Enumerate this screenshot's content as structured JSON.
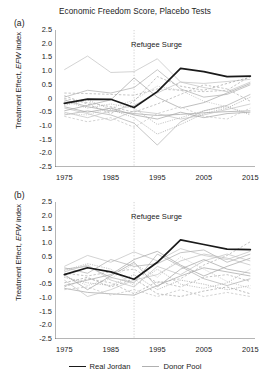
{
  "figure": {
    "title": "Economic Freedom Score, Placebo Tests",
    "panels": [
      {
        "tag": "(a)",
        "annotation": "Refugee Surge"
      },
      {
        "tag": "(b)",
        "annotation": "Refugee Surge"
      }
    ],
    "legend": [
      {
        "label": "Real Jordan",
        "color": "#1a1a1a",
        "style": "solid"
      },
      {
        "label": "Donor Pool",
        "color": "#b0b0b0",
        "style": "solid"
      }
    ]
  },
  "chart_data": {
    "type": "line",
    "title": "Economic Freedom Score, Placebo Tests",
    "xlabel": "",
    "ylabel": "Treatment Effect, EFW index",
    "xlim": [
      1973,
      2016
    ],
    "ylim": [
      -2.5,
      2.5
    ],
    "xticks": [
      1975,
      1985,
      1995,
      2005,
      2015
    ],
    "yticks": [
      "2.5",
      "2.0",
      "1.5",
      "1.0",
      "0.5",
      "0",
      "-0.5",
      "-1.0",
      "-1.5",
      "-2.0",
      "-2.5"
    ],
    "grid": false,
    "legend_position": "bottom-center",
    "annotations": [
      {
        "text": "Refugee Surge",
        "x": 1990,
        "y": 1.95,
        "vline_x": 1990,
        "vline_style": "dotted"
      }
    ],
    "x": [
      1975,
      1980,
      1985,
      1990,
      1995,
      2000,
      2005,
      2010,
      2015
    ],
    "panels": [
      {
        "tag": "(a)",
        "series": [
          {
            "name": "Real Jordan",
            "role": "treated",
            "color": "#1a1a1a",
            "values": [
              -0.18,
              -0.02,
              -0.03,
              -0.33,
              0.25,
              1.1,
              0.98,
              0.8,
              0.82
            ]
          },
          {
            "name": "Donor 1",
            "role": "placebo",
            "values": [
              1.05,
              1.55,
              0.95,
              0.98,
              1.45,
              0.6,
              0.55,
              0.62,
              0.7
            ]
          },
          {
            "name": "Donor 2",
            "role": "placebo",
            "values": [
              0.2,
              0.18,
              0.15,
              0.12,
              0.35,
              0.3,
              0.25,
              0.3,
              0.82
            ]
          },
          {
            "name": "Donor 3",
            "role": "placebo",
            "values": [
              -0.05,
              -0.3,
              -0.45,
              -0.55,
              -0.62,
              -0.58,
              -0.52,
              -0.48,
              -0.45
            ]
          },
          {
            "name": "Donor 4",
            "role": "placebo",
            "values": [
              -0.55,
              -0.6,
              -0.35,
              -0.05,
              0.45,
              0.3,
              -0.1,
              -0.3,
              -0.55
            ]
          },
          {
            "name": "Donor 5",
            "role": "placebo",
            "values": [
              -0.6,
              -0.45,
              -0.6,
              -0.9,
              -1.7,
              -0.85,
              -0.45,
              -0.25,
              0.15
            ]
          },
          {
            "name": "Donor 6",
            "role": "placebo",
            "values": [
              0.1,
              -0.2,
              -0.55,
              -0.1,
              0.8,
              0.45,
              0.3,
              0.55,
              0.78
            ]
          },
          {
            "name": "Donor 7",
            "role": "placebo",
            "values": [
              -0.35,
              -0.55,
              -0.8,
              -0.45,
              -0.55,
              -0.75,
              -0.6,
              -0.4,
              -0.2
            ]
          },
          {
            "name": "Donor 8",
            "role": "placebo",
            "values": [
              -0.1,
              -0.35,
              -0.2,
              -0.35,
              -0.95,
              -0.7,
              -0.45,
              -0.3,
              -0.6
            ]
          },
          {
            "name": "Donor 9",
            "role": "placebo",
            "values": [
              -0.45,
              -0.25,
              -0.05,
              0.75,
              0.05,
              -0.35,
              -0.15,
              0.2,
              0.55
            ]
          },
          {
            "name": "Donor 10",
            "role": "placebo",
            "values": [
              -0.65,
              -0.85,
              -0.7,
              -1.05,
              -0.55,
              -0.3,
              -0.65,
              -0.75,
              -0.35
            ]
          },
          {
            "name": "Donor 11",
            "role": "placebo",
            "values": [
              0.05,
              0.3,
              0.2,
              0.4,
              1.05,
              0.35,
              0.05,
              0.15,
              0.5
            ]
          },
          {
            "name": "Donor 12",
            "role": "placebo",
            "values": [
              -0.25,
              -0.05,
              -0.4,
              -0.7,
              -1.3,
              -0.95,
              -0.55,
              -0.35,
              0.05
            ]
          },
          {
            "name": "Donor 13",
            "role": "placebo",
            "values": [
              -0.5,
              -0.7,
              -0.45,
              -0.25,
              0.2,
              0.6,
              0.4,
              0.25,
              0.6
            ]
          },
          {
            "name": "Donor 14",
            "role": "placebo",
            "values": [
              0.0,
              -0.15,
              -0.3,
              -0.5,
              -0.2,
              0.15,
              0.5,
              0.35,
              -0.1
            ]
          },
          {
            "name": "Donor 15",
            "role": "placebo",
            "values": [
              -0.3,
              -0.5,
              -0.35,
              -0.6,
              -0.75,
              -0.5,
              -0.7,
              -0.55,
              -0.5
            ]
          }
        ]
      },
      {
        "tag": "(b)",
        "series": [
          {
            "name": "Real Jordan",
            "role": "treated",
            "color": "#1a1a1a",
            "values": [
              -0.15,
              0.1,
              -0.05,
              -0.32,
              0.3,
              1.12,
              0.95,
              0.78,
              0.76
            ]
          },
          {
            "name": "Donor 1",
            "role": "placebo",
            "values": [
              0.15,
              0.55,
              0.3,
              0.68,
              0.35,
              0.8,
              0.55,
              0.4,
              0.7
            ]
          },
          {
            "name": "Donor 2",
            "role": "placebo",
            "values": [
              -0.1,
              -0.2,
              -0.05,
              0.05,
              -0.45,
              -0.3,
              0.2,
              0.55,
              1.05
            ]
          },
          {
            "name": "Donor 3",
            "role": "placebo",
            "values": [
              -0.65,
              -0.8,
              -0.85,
              -0.9,
              -0.55,
              -0.2,
              0.1,
              -0.05,
              -0.2
            ]
          },
          {
            "name": "Donor 4",
            "role": "placebo",
            "values": [
              -0.2,
              -0.55,
              -0.3,
              0.25,
              -0.25,
              0.5,
              0.05,
              -0.4,
              -0.65
            ]
          },
          {
            "name": "Donor 5",
            "role": "placebo",
            "values": [
              0.05,
              0.15,
              -0.25,
              -0.45,
              0.6,
              0.15,
              -0.3,
              -0.55,
              -0.3
            ]
          },
          {
            "name": "Donor 6",
            "role": "placebo",
            "values": [
              -0.45,
              -0.25,
              -0.6,
              -0.3,
              -0.85,
              -0.95,
              -0.75,
              -0.6,
              -0.85
            ]
          },
          {
            "name": "Donor 7",
            "role": "placebo",
            "values": [
              -0.35,
              -0.95,
              -0.7,
              -0.35,
              -0.15,
              0.35,
              0.6,
              0.45,
              0.2
            ]
          },
          {
            "name": "Donor 8",
            "role": "placebo",
            "values": [
              0.0,
              0.25,
              0.05,
              -0.55,
              0.05,
              -0.5,
              -0.65,
              -0.45,
              0.05
            ]
          },
          {
            "name": "Donor 9",
            "role": "placebo",
            "values": [
              -0.55,
              -0.35,
              -0.15,
              0.4,
              0.7,
              0.2,
              -0.2,
              0.15,
              0.45
            ]
          },
          {
            "name": "Donor 10",
            "role": "placebo",
            "values": [
              -0.7,
              -0.6,
              -0.9,
              -0.7,
              -0.95,
              -0.7,
              -0.95,
              -0.8,
              -0.95
            ]
          },
          {
            "name": "Donor 11",
            "role": "placebo",
            "values": [
              0.1,
              -0.1,
              0.4,
              0.15,
              0.25,
              0.65,
              0.75,
              0.3,
              0.6
            ]
          },
          {
            "name": "Donor 12",
            "role": "placebo",
            "values": [
              -0.25,
              -0.45,
              -0.55,
              -0.15,
              -0.7,
              -0.35,
              -0.5,
              -0.7,
              -0.55
            ]
          },
          {
            "name": "Donor 13",
            "role": "placebo",
            "values": [
              -0.05,
              0.2,
              -0.35,
              -0.6,
              0.15,
              -0.15,
              0.35,
              0.6,
              0.35
            ]
          },
          {
            "name": "Donor 14",
            "role": "placebo",
            "values": [
              -0.6,
              -0.3,
              -0.45,
              -0.85,
              -0.4,
              -0.6,
              -0.25,
              -0.15,
              -0.4
            ]
          },
          {
            "name": "Donor 15",
            "role": "placebo",
            "values": [
              -0.15,
              -0.7,
              -0.2,
              0.3,
              -0.6,
              0.05,
              0.4,
              0.05,
              -0.1
            ]
          }
        ]
      }
    ]
  }
}
